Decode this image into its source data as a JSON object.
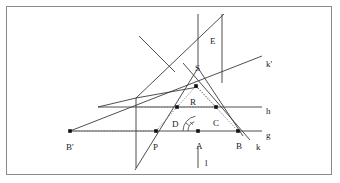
{
  "figure": {
    "kind": "geometric-construction-diagram",
    "background": "#ffffff",
    "stroke_color": "#3b3b3b",
    "dotted_color": "#6e6e6e",
    "border_color": "#8a8a8a",
    "width": 340,
    "height": 183
  },
  "points": [
    {
      "id": "A",
      "label": "A",
      "x": 198,
      "y": 131,
      "label_x": 196,
      "label_y": 142,
      "dot": true
    },
    {
      "id": "B",
      "label": "B",
      "x": 238,
      "y": 131,
      "label_x": 236,
      "label_y": 142,
      "dot": true
    },
    {
      "id": "Bp",
      "label": "B'",
      "x": 70,
      "y": 131,
      "label_x": 66,
      "label_y": 143,
      "dot": true
    },
    {
      "id": "C",
      "label": "C",
      "x": 216,
      "y": 107,
      "label_x": 213,
      "label_y": 119,
      "dot": true
    },
    {
      "id": "D",
      "label": "D",
      "x": 177,
      "y": 107,
      "label_x": 172,
      "label_y": 120,
      "dot": true
    },
    {
      "id": "P",
      "label": "P",
      "x": 156,
      "y": 131,
      "label_x": 153,
      "label_y": 143,
      "dot": true
    },
    {
      "id": "R",
      "label": "R",
      "x": 196,
      "y": 86,
      "label_x": 190,
      "label_y": 98,
      "dot": true
    },
    {
      "id": "S",
      "label": "S",
      "x": 198,
      "y": 68,
      "label_x": 195,
      "label_y": 64,
      "dot": false
    },
    {
      "id": "E",
      "label": "E",
      "x": 212,
      "y": 36,
      "label_x": 210,
      "label_y": 37,
      "dot": false
    }
  ],
  "line_labels": [
    {
      "id": "h",
      "label": "h",
      "x": 266,
      "y": 107
    },
    {
      "id": "g",
      "label": "g",
      "x": 266,
      "y": 131
    },
    {
      "id": "k",
      "label": "k",
      "x": 256,
      "y": 143
    },
    {
      "id": "kp",
      "label": "k'",
      "x": 266,
      "y": 60
    },
    {
      "id": "l",
      "label": "l",
      "x": 205,
      "y": 159
    }
  ],
  "chart_data": {
    "type": "diagram",
    "title": "",
    "solid_lines": [
      {
        "name": "line-g",
        "x1": 70,
        "y1": 131,
        "x2": 262,
        "y2": 131
      },
      {
        "name": "line-h",
        "x1": 98,
        "y1": 107,
        "x2": 262,
        "y2": 107
      },
      {
        "name": "line-l-segment",
        "x1": 198,
        "y1": 146,
        "x2": 198,
        "y2": 168
      },
      {
        "name": "vertical-left",
        "x1": 136,
        "y1": 98,
        "x2": 136,
        "y2": 168
      },
      {
        "name": "vertical-axis-top",
        "x1": 198,
        "y1": 14,
        "x2": 198,
        "y2": 68
      },
      {
        "name": "vertical-right-E",
        "x1": 222,
        "y1": 14,
        "x2": 222,
        "y2": 83
      },
      {
        "name": "line-k-prime",
        "x1": 70,
        "y1": 131,
        "x2": 262,
        "y2": 56
      },
      {
        "name": "line-k",
        "x1": 183,
        "y1": 63,
        "x2": 250,
        "y2": 140
      },
      {
        "name": "ray-S-to-B",
        "x1": 198,
        "y1": 68,
        "x2": 243,
        "y2": 136
      },
      {
        "name": "ray-S-to-left",
        "x1": 198,
        "y1": 68,
        "x2": 135,
        "y2": 170
      },
      {
        "name": "diagonal-up-right",
        "x1": 136,
        "y1": 98,
        "x2": 224,
        "y2": 14
      },
      {
        "name": "diagonal-cross",
        "x1": 139,
        "y1": 36,
        "x2": 175,
        "y2": 72
      },
      {
        "name": "left-wing-upper",
        "x1": 98,
        "y1": 107,
        "x2": 136,
        "y2": 98
      },
      {
        "name": "P-to-R-left",
        "x1": 136,
        "y1": 98,
        "x2": 198,
        "y2": 87
      }
    ],
    "dotted_lines": [
      {
        "name": "dot-Bp-to-P",
        "x1": 70,
        "y1": 131,
        "x2": 156,
        "y2": 131
      },
      {
        "name": "dot-h-to-C",
        "x1": 136,
        "y1": 107,
        "x2": 216,
        "y2": 107
      },
      {
        "name": "dot-R-to-C",
        "x1": 196,
        "y1": 86,
        "x2": 216,
        "y2": 107
      },
      {
        "name": "dot-R-to-B",
        "x1": 196,
        "y1": 86,
        "x2": 238,
        "y2": 131
      },
      {
        "name": "dot-D-to-R",
        "x1": 177,
        "y1": 107,
        "x2": 196,
        "y2": 86
      },
      {
        "name": "dot-P-to-D",
        "x1": 156,
        "y1": 131,
        "x2": 177,
        "y2": 107
      }
    ],
    "angle_arcs": [
      {
        "name": "angle-arc-small",
        "cx": 198,
        "cy": 131,
        "r": 10,
        "a1": 112,
        "a2": 180
      },
      {
        "name": "angle-arc-large",
        "cx": 198,
        "cy": 131,
        "r": 15,
        "a1": 100,
        "a2": 180
      }
    ],
    "tick_marks": [
      {
        "name": "tick-small",
        "x": 190,
        "y": 122
      },
      {
        "name": "tick-large",
        "x": 186,
        "y": 123
      }
    ]
  }
}
